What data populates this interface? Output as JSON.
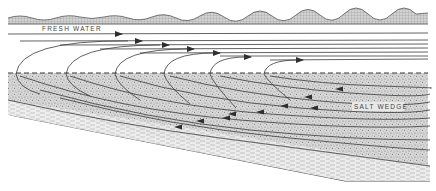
{
  "diagram": {
    "labels": {
      "fresh_water": "FRESH WATER",
      "salt_wedge": "SALT WEDGE"
    },
    "colors": {
      "line": "#3a3a3a",
      "surface_fill": "#bdbdbd",
      "salt_fill": "#cfcfcf",
      "bed_fill": "#e6e6e6",
      "background": "#ffffff"
    },
    "elements": {
      "water_surface": "wavy surface with hatched fill",
      "fresh_water_layer": "seaward-flowing upper layer with rightward arrows",
      "mixing_loops": "entrainment loops curving up from interface",
      "interface": "dashed halocline line",
      "salt_wedge_layer": "stippled landward-flowing lower layer with leftward arrows",
      "sediment_bed": "sloping bed with dashed fill"
    }
  }
}
